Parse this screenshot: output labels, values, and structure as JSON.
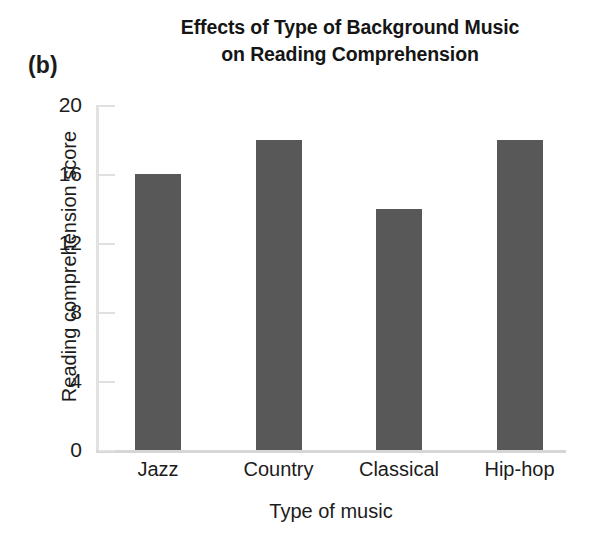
{
  "panel": {
    "letter": "(b)"
  },
  "title": {
    "line1": "Effects of Type of Background Music",
    "line2": "on Reading Comprehension"
  },
  "axes": {
    "x_title": "Type of music",
    "y_title": "Reading comprehension score",
    "y_ticks": [
      "0",
      "4",
      "8",
      "12",
      "16",
      "20"
    ]
  },
  "colors": {
    "bar_fill": "#585858",
    "axis_line": "#dcdcdc",
    "text": "#1c1c1c",
    "background": "#ffffff"
  },
  "chart_data": {
    "type": "bar",
    "title": "Effects of Type of Background Music on Reading Comprehension",
    "xlabel": "Type of music",
    "ylabel": "Reading comprehension score",
    "categories": [
      "Jazz",
      "Country",
      "Classical",
      "Hip-hop"
    ],
    "values": [
      16,
      18,
      14,
      18
    ],
    "ylim": [
      0,
      20
    ],
    "yticks": [
      0,
      4,
      8,
      12,
      16,
      20
    ],
    "grid": false,
    "legend": "none",
    "bar_color": "#585858"
  }
}
